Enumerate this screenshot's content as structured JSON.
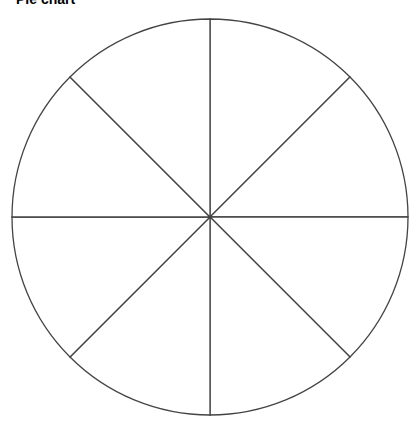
{
  "chart_data": {
    "type": "pie",
    "title": "Pie chart",
    "categories": [
      "Slice 1",
      "Slice 2",
      "Slice 3",
      "Slice 4",
      "Slice 5",
      "Slice 6",
      "Slice 7",
      "Slice 8"
    ],
    "values": [
      12.5,
      12.5,
      12.5,
      12.5,
      12.5,
      12.5,
      12.5,
      12.5
    ],
    "slice_fill": "#ffffff",
    "line_color": "#444444",
    "legend": "none",
    "labels_shown": false
  },
  "geometry": {
    "cx": 210,
    "cy": 217,
    "r": 198
  }
}
